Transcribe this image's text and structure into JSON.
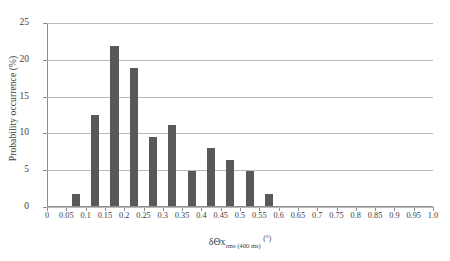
{
  "chart_data": {
    "type": "bar",
    "title": "",
    "xlabel": "δΘx rms (400 ms) (°)",
    "xlabel_parts": {
      "base": "δΘx",
      "subscript": "rms (400 ms)",
      "unit": "(°)"
    },
    "ylabel": "Probability occurrence (%)",
    "xlim": [
      0,
      1.0
    ],
    "ylim": [
      0,
      25
    ],
    "grid": "horizontal",
    "legend": "none",
    "bar_color": "#595959",
    "xticks": [
      "0",
      "0.05",
      "0.1",
      "0.15",
      "0.2",
      "0.25",
      "0.3",
      "0.35",
      "0.4",
      "0.45",
      "0.5",
      "0.55",
      "0.6",
      "0.65",
      "0.7",
      "0.75",
      "0.8",
      "0.85",
      "0.9",
      "0.95",
      "1.0"
    ],
    "xtick_values": [
      0,
      0.05,
      0.1,
      0.15,
      0.2,
      0.25,
      0.3,
      0.35,
      0.4,
      0.45,
      0.5,
      0.55,
      0.6,
      0.65,
      0.7,
      0.75,
      0.8,
      0.85,
      0.9,
      0.95,
      1.0
    ],
    "yticks": [
      "0",
      "5",
      "10",
      "15",
      "20",
      "25"
    ],
    "ytick_values": [
      0,
      5,
      10,
      15,
      20,
      25
    ],
    "bin_width": 0.05,
    "categories": [
      "0.05-0.10",
      "0.10-0.15",
      "0.15-0.20",
      "0.20-0.25",
      "0.25-0.30",
      "0.30-0.35",
      "0.35-0.40",
      "0.40-0.45",
      "0.45-0.50",
      "0.50-0.55",
      "0.55-0.60"
    ],
    "bin_starts": [
      0.05,
      0.1,
      0.15,
      0.2,
      0.25,
      0.3,
      0.35,
      0.4,
      0.45,
      0.5,
      0.55
    ],
    "values": [
      1.6,
      12.4,
      21.8,
      18.7,
      9.4,
      11.0,
      4.7,
      7.9,
      6.3,
      4.8,
      1.7
    ]
  }
}
